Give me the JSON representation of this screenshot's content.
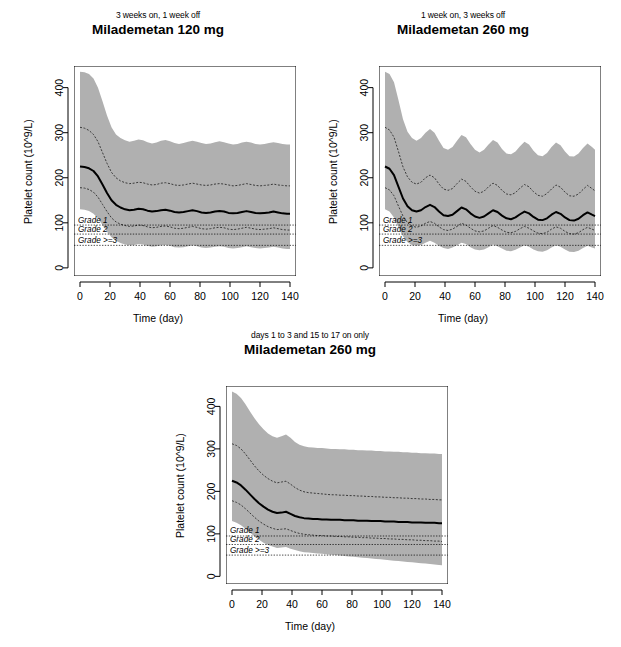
{
  "figure": {
    "width": 621,
    "height": 647,
    "background": "#ffffff",
    "band_color": "#b0b0b0",
    "median_color": "#000000",
    "quantile_color": "#3a3a3a",
    "frame_color": "#000000"
  },
  "axes": {
    "x_label": "Time (day)",
    "y_label": "Platelet count (10^9/L)",
    "x_ticks": [
      0,
      20,
      40,
      60,
      80,
      100,
      120,
      140
    ],
    "y_ticks": [
      0,
      100,
      200,
      300,
      400
    ],
    "xlim": [
      -4,
      144
    ],
    "ylim": [
      -18,
      448
    ]
  },
  "grades": [
    {
      "label": "Grade 1",
      "value": 95
    },
    {
      "label": "Grade 2",
      "value": 75
    },
    {
      "label": "Grade >=3",
      "value": 50
    }
  ],
  "panels": [
    {
      "id": "panel-120mg-3on1off",
      "subtitle": "3 weeks on, 1 week off",
      "title": "Milademetan 120 mg",
      "chart_data": {
        "type": "area",
        "title": "Milademetan 120 mg",
        "subtitle": "3 weeks on, 1 week off",
        "xlabel": "Time (day)",
        "ylabel": "Platelet count (10^9/L)",
        "xlim": [
          -4,
          144
        ],
        "ylim": [
          -18,
          448
        ],
        "grid": false,
        "legend": "none",
        "x": [
          0,
          3,
          6,
          9,
          12,
          15,
          18,
          21,
          24,
          27,
          30,
          33,
          36,
          39,
          42,
          45,
          48,
          51,
          54,
          57,
          60,
          63,
          66,
          69,
          72,
          75,
          78,
          81,
          84,
          87,
          90,
          93,
          96,
          99,
          102,
          105,
          108,
          111,
          114,
          117,
          120,
          123,
          126,
          129,
          132,
          135,
          138,
          140
        ],
        "series": [
          {
            "name": "upper band (95th percentile)",
            "values": [
              435,
              434,
              430,
              420,
              400,
              370,
              338,
              312,
              296,
              288,
              283,
              280,
              282,
              285,
              283,
              279,
              276,
              278,
              282,
              284,
              281,
              277,
              275,
              277,
              280,
              282,
              280,
              277,
              275,
              276,
              279,
              281,
              279,
              276,
              274,
              275,
              278,
              280,
              278,
              275,
              274,
              275,
              277,
              279,
              277,
              275,
              274,
              274
            ]
          },
          {
            "name": "upper quantile (75th percentile)",
            "values": [
              312,
              310,
              305,
              296,
              280,
              256,
              232,
              212,
              200,
              193,
              189,
              187,
              188,
              190,
              189,
              186,
              184,
              185,
              188,
              189,
              187,
              184,
              183,
              184,
              186,
              188,
              186,
              184,
              183,
              184,
              186,
              187,
              186,
              184,
              182,
              183,
              185,
              187,
              185,
              183,
              182,
              183,
              184,
              186,
              184,
              183,
              182,
              182
            ]
          },
          {
            "name": "median (50th percentile)",
            "values": [
              225,
              224,
              221,
              215,
              203,
              185,
              166,
              150,
              140,
              134,
              130,
              128,
              129,
              131,
              130,
              127,
              125,
              126,
              128,
              129,
              127,
              124,
              123,
              124,
              126,
              128,
              126,
              123,
              122,
              123,
              125,
              126,
              125,
              122,
              121,
              122,
              124,
              126,
              124,
              122,
              121,
              122,
              123,
              125,
              123,
              121,
              120,
              120
            ]
          },
          {
            "name": "lower quantile (25th percentile)",
            "values": [
              178,
              177,
              174,
              168,
              157,
              141,
              125,
              111,
              102,
              97,
              94,
              92,
              93,
              95,
              94,
              91,
              89,
              90,
              92,
              93,
              91,
              88,
              87,
              88,
              90,
              92,
              90,
              87,
              86,
              87,
              89,
              90,
              89,
              86,
              85,
              86,
              88,
              90,
              88,
              86,
              85,
              86,
              87,
              89,
              87,
              85,
              84,
              84
            ]
          },
          {
            "name": "lower band (5th percentile)",
            "values": [
              130,
              129,
              126,
              120,
              110,
              95,
              80,
              68,
              60,
              55,
              52,
              50,
              51,
              53,
              52,
              49,
              47,
              48,
              50,
              51,
              49,
              46,
              45,
              46,
              48,
              50,
              48,
              45,
              44,
              45,
              47,
              48,
              47,
              44,
              43,
              44,
              46,
              48,
              46,
              44,
              43,
              44,
              45,
              47,
              45,
              43,
              42,
              42
            ]
          }
        ]
      }
    },
    {
      "id": "panel-260mg-1on3off",
      "subtitle": "1 week on, 3 weeks off",
      "title": "Milademetan 260 mg",
      "chart_data": {
        "type": "area",
        "title": "Milademetan 260 mg",
        "subtitle": "1 week on, 3 weeks off",
        "xlabel": "Time (day)",
        "ylabel": "Platelet count (10^9/L)",
        "xlim": [
          -4,
          144
        ],
        "ylim": [
          -18,
          448
        ],
        "grid": false,
        "legend": "none",
        "x": [
          0,
          3,
          6,
          9,
          12,
          15,
          18,
          21,
          24,
          27,
          30,
          33,
          36,
          39,
          42,
          45,
          48,
          51,
          54,
          57,
          60,
          63,
          66,
          69,
          72,
          75,
          78,
          81,
          84,
          87,
          90,
          93,
          96,
          99,
          102,
          105,
          108,
          111,
          114,
          117,
          120,
          123,
          126,
          129,
          132,
          135,
          138,
          140
        ],
        "series": [
          {
            "name": "upper band (95th percentile)",
            "values": [
              435,
              430,
              412,
              372,
              330,
              302,
              288,
              282,
              288,
              300,
              308,
              300,
              282,
              266,
              262,
              268,
              282,
              295,
              290,
              275,
              262,
              256,
              262,
              274,
              284,
              278,
              264,
              254,
              252,
              258,
              270,
              280,
              274,
              260,
              250,
              248,
              255,
              268,
              278,
              272,
              258,
              248,
              247,
              254,
              266,
              276,
              268,
              262
            ]
          },
          {
            "name": "upper quantile (75th percentile)",
            "values": [
              312,
              306,
              290,
              258,
              224,
              202,
              190,
              186,
              190,
              200,
              206,
              200,
              186,
              175,
              172,
              176,
              187,
              197,
              192,
              180,
              170,
              166,
              170,
              180,
              188,
              183,
              172,
              164,
              162,
              167,
              177,
              185,
              180,
              169,
              161,
              159,
              165,
              175,
              184,
              179,
              168,
              160,
              159,
              164,
              174,
              183,
              176,
              171
            ]
          },
          {
            "name": "median (50th percentile)",
            "values": [
              225,
              220,
              206,
              180,
              154,
              137,
              128,
              125,
              128,
              135,
              140,
              135,
              125,
              117,
              115,
              118,
              126,
              134,
              130,
              121,
              114,
              111,
              114,
              121,
              128,
              124,
              116,
              110,
              108,
              112,
              119,
              125,
              121,
              113,
              107,
              106,
              110,
              118,
              124,
              120,
              112,
              106,
              105,
              109,
              117,
              123,
              118,
              115
            ]
          },
          {
            "name": "lower quantile (25th percentile)",
            "values": [
              178,
              173,
              160,
              137,
              115,
              100,
              93,
              90,
              93,
              99,
              103,
              99,
              91,
              85,
              83,
              86,
              92,
              99,
              95,
              88,
              82,
              80,
              82,
              88,
              94,
              90,
              84,
              79,
              78,
              81,
              87,
              92,
              88,
              82,
              77,
              76,
              79,
              86,
              91,
              88,
              81,
              76,
              75,
              78,
              85,
              90,
              86,
              83
            ]
          },
          {
            "name": "lower band (5th percentile)",
            "values": [
              130,
              125,
              112,
              90,
              70,
              57,
              51,
              49,
              51,
              56,
              60,
              56,
              49,
              44,
              42,
              45,
              50,
              56,
              53,
              46,
              41,
              39,
              41,
              46,
              52,
              48,
              43,
              38,
              37,
              40,
              45,
              50,
              47,
              41,
              37,
              36,
              39,
              45,
              50,
              47,
              41,
              36,
              35,
              38,
              44,
              49,
              45,
              43
            ]
          }
        ]
      }
    },
    {
      "id": "panel-260mg-days1to3-15to17",
      "subtitle": "days 1 to 3 and 15 to 17 on only",
      "title": "Milademetan 260 mg",
      "chart_data": {
        "type": "area",
        "title": "Milademetan 260 mg",
        "subtitle": "days 1 to 3 and 15 to 17 on only",
        "xlabel": "Time (day)",
        "ylabel": "Platelet count (10^9/L)",
        "xlim": [
          -4,
          144
        ],
        "ylim": [
          -18,
          448
        ],
        "grid": false,
        "legend": "none",
        "x": [
          0,
          3,
          6,
          9,
          12,
          15,
          18,
          21,
          24,
          27,
          30,
          33,
          36,
          39,
          42,
          45,
          48,
          51,
          54,
          57,
          60,
          63,
          66,
          69,
          72,
          75,
          78,
          81,
          84,
          87,
          90,
          93,
          96,
          99,
          102,
          105,
          108,
          111,
          114,
          117,
          120,
          123,
          126,
          129,
          132,
          135,
          138,
          140
        ],
        "series": [
          {
            "name": "upper band (95th percentile)",
            "values": [
              435,
              430,
              420,
              405,
              388,
              372,
              358,
              346,
              336,
              330,
              326,
              330,
              334,
              326,
              316,
              310,
              306,
              304,
              303,
              302,
              302,
              301,
              300,
              300,
              299,
              299,
              298,
              298,
              297,
              297,
              296,
              296,
              295,
              295,
              294,
              294,
              293,
              293,
              292,
              292,
              291,
              291,
              290,
              290,
              289,
              289,
              288,
              288
            ]
          },
          {
            "name": "upper quantile (75th percentile)",
            "values": [
              312,
              308,
              300,
              288,
              274,
              260,
              248,
              238,
              230,
              224,
              220,
              222,
              224,
              217,
              209,
              203,
              199,
              197,
              196,
              195,
              194,
              193,
              192,
              192,
              191,
              191,
              190,
              190,
              189,
              189,
              188,
              188,
              187,
              187,
              186,
              186,
              185,
              185,
              184,
              184,
              183,
              183,
              182,
              182,
              181,
              181,
              180,
              180
            ]
          },
          {
            "name": "median (50th percentile)",
            "values": [
              225,
              221,
              214,
              204,
              193,
              182,
              172,
              164,
              157,
              152,
              149,
              150,
              152,
              147,
              142,
              139,
              137,
              136,
              135,
              135,
              134,
              134,
              133,
              133,
              133,
              132,
              132,
              132,
              131,
              131,
              131,
              130,
              130,
              130,
              129,
              129,
              129,
              128,
              128,
              128,
              127,
              127,
              127,
              126,
              126,
              126,
              125,
              125
            ]
          },
          {
            "name": "lower quantile (25th percentile)",
            "values": [
              178,
              174,
              168,
              159,
              149,
              139,
              130,
              123,
              117,
              113,
              110,
              111,
              112,
              108,
              104,
              101,
              99,
              98,
              97,
              96,
              96,
              95,
              95,
              94,
              94,
              93,
              93,
              92,
              92,
              91,
              91,
              90,
              90,
              89,
              89,
              88,
              88,
              87,
              87,
              86,
              86,
              85,
              85,
              84,
              84,
              83,
              83,
              82
            ]
          },
          {
            "name": "lower band (5th percentile)",
            "values": [
              130,
              126,
              120,
              112,
              103,
              94,
              86,
              79,
              74,
              70,
              67,
              68,
              69,
              65,
              62,
              59,
              57,
              56,
              55,
              54,
              53,
              52,
              51,
              50,
              49,
              48,
              47,
              46,
              45,
              44,
              43,
              42,
              41,
              40,
              39,
              38,
              37,
              36,
              35,
              34,
              33,
              32,
              31,
              30,
              29,
              28,
              27,
              26
            ]
          }
        ]
      }
    }
  ]
}
